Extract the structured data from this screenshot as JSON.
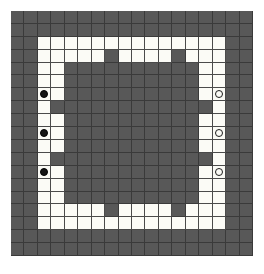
{
  "board": {
    "name": "grid-board",
    "cols": 18,
    "rows": 19,
    "colors": {
      "dark_cell": "#585858",
      "light_cell": "#fbfbf6",
      "gridline": "#3a3a3a",
      "black_stone": "#141414",
      "white_stone": "#fbfbf6",
      "page_background": "#ffffff"
    },
    "legend": {
      "dark": "blocked / wall cell",
      "light": "open path cell",
      "black_stone": "black piece",
      "white_stone": "white piece"
    },
    "counts": {
      "black_stones": 3,
      "white_stones": 3,
      "total_cells": 342
    },
    "cells": [
      "DDDDDDDDDDDDDDDDDD",
      "DDDDDDDDDDDDDDDDDD",
      "DDLLLLLLLLLLLLLLDD",
      "DDLLLLLDLLLLDLLLDD",
      "DDLLDDDDDDDDDDLLDD",
      "DDLLDDDDDDDDDDLLDD",
      "DDBLDDDDDDDDDDLWDD",
      "DDLDDDDDDDDDDDDLDD",
      "DDLLDDDDDDDDDDLLDD",
      "DDBLDDDDDDDDDDLWDD",
      "DDLLDDDDDDDDDDLLDD",
      "DDLDDDDDDDDDDDDLDD",
      "DDBLDDDDDDDDDDLWDD",
      "DDLLDDDDDDDDDDLLDD",
      "DDLLDDDDDDDDDDLLDD",
      "DDLLLLLDLLLLDLLLDD",
      "DDLLLLLLLLLLLLLLDD",
      "DDDDDDDDDDDDDDDDDD",
      "DDDDDDDDDDDDDDDDDD"
    ]
  }
}
